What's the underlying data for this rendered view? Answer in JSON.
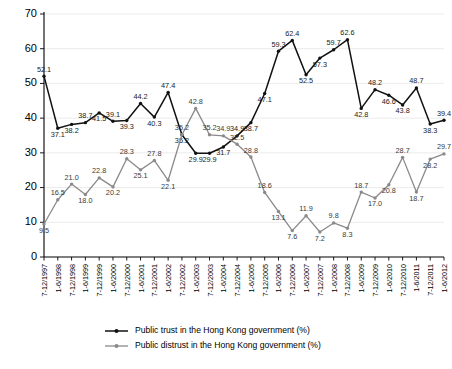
{
  "chart_data": {
    "type": "line",
    "title": "",
    "xlabel": "",
    "ylabel": "",
    "ylim": [
      0,
      70
    ],
    "yticks": [
      0,
      10,
      20,
      30,
      40,
      50,
      60,
      70
    ],
    "grid": true,
    "legend_position": "bottom",
    "categories": [
      "7-12/1997",
      "1-6/1998",
      "7-12/1998",
      "1-6/1999",
      "7-12/1999",
      "1-6/2000",
      "7-12/2000",
      "1-6/2001",
      "7-12/2001",
      "1-6/2002",
      "7-12/2002",
      "1-6/2003",
      "7-12/2003",
      "1-6/2004",
      "7-12/2004",
      "1-6/2005",
      "7-12/2005",
      "1-6/2006",
      "7-12/2006",
      "1-6/2007",
      "7-12/2007",
      "1-6/2008",
      "7-12/2008",
      "1-6/2009",
      "7-12/2009",
      "1-6/2010",
      "7-12/2010",
      "1-6/2011",
      "7-12/2011",
      "1-6/2012"
    ],
    "series": [
      {
        "name": "Public trust in the Hong Kong government (%)",
        "color": "#111111",
        "values": [
          52.1,
          37.1,
          38.2,
          38.7,
          41.5,
          39.1,
          39.3,
          44.2,
          40.3,
          47.4,
          35.2,
          29.9,
          29.9,
          31.7,
          34.9,
          38.7,
          47.1,
          59.3,
          62.4,
          52.5,
          57.3,
          59.7,
          62.6,
          42.8,
          48.2,
          46.6,
          43.8,
          48.7,
          38.3,
          39.4
        ]
      },
      {
        "name": "Public distrust in the Hong Kong government (%)",
        "color": "#8a8a8a",
        "values": [
          9.5,
          16.5,
          21.0,
          18.0,
          22.8,
          20.2,
          28.3,
          25.1,
          27.8,
          22.1,
          35.2,
          42.8,
          35.2,
          34.9,
          32.5,
          28.8,
          18.6,
          13.1,
          7.6,
          11.9,
          7.2,
          9.8,
          8.3,
          18.7,
          17.0,
          20.8,
          28.7,
          18.7,
          28.2,
          29.7
        ]
      }
    ],
    "extra_trust_tail": {
      "note_values": [
        35.5,
        34.1
      ]
    }
  },
  "legend": {
    "items": [
      {
        "label": "Public trust in the Hong Kong government (%)",
        "marker": "line-marker-black"
      },
      {
        "label": "Public distrust in the Hong Kong government (%)",
        "marker": "line-marker-gray"
      }
    ]
  }
}
